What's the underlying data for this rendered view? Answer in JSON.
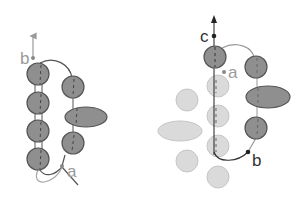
{
  "figures": [
    {
      "id": "left",
      "labels": {
        "b": "b",
        "a": "a"
      }
    },
    {
      "id": "right",
      "labels": {
        "c": "c",
        "a": "a",
        "b": "b"
      }
    }
  ],
  "colors": {
    "dark_bead": "#8f8f8f",
    "dark_stroke": "#555555",
    "light_bead": "#d9d9d9",
    "light_stroke": "#c4c4c4",
    "thread": "#555555",
    "thread_light": "#a8a8a8",
    "label_gray": "#9a9a9a",
    "label_dark": "#333333"
  }
}
